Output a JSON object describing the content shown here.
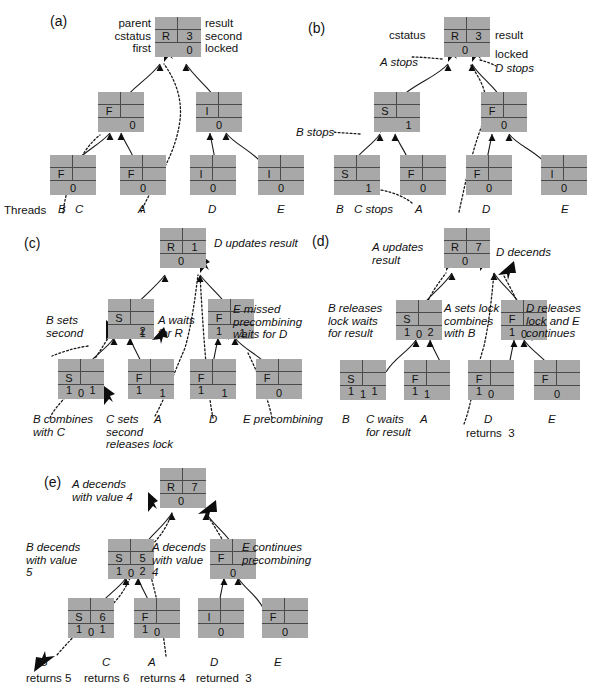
{
  "figure": {
    "type": "combining-tree-state-diagram",
    "background": "#ffffff",
    "node_fill": "#a8a8a8",
    "line_color": "#1a1a1a",
    "threads_label": "Threads",
    "thread_names": [
      "B",
      "C",
      "A",
      "D",
      "E"
    ]
  },
  "panels": [
    {
      "id": "a",
      "label": "(a)",
      "root": {
        "c1": "R",
        "c2": "3",
        "r2l": "",
        "r2r": "",
        "bottom": "0"
      },
      "mid": [
        {
          "c1": "F",
          "c2": "",
          "r2l": "",
          "r2r": "",
          "bottom": "0"
        },
        {
          "c1": "I",
          "c2": "",
          "r2l": "",
          "r2r": "",
          "bottom": "0"
        }
      ],
      "leaves": [
        {
          "c1": "F",
          "c2": "",
          "r2l": "",
          "r2r": "",
          "bottom": "0"
        },
        {
          "c1": "F",
          "c2": "",
          "r2l": "",
          "r2r": "",
          "bottom": "0"
        },
        {
          "c1": "I",
          "c2": "",
          "r2l": "",
          "r2r": "",
          "bottom": "0"
        },
        {
          "c1": "I",
          "c2": "",
          "r2l": "",
          "r2r": "",
          "bottom": "0"
        }
      ],
      "annotations": [
        {
          "text": "parent\ncstatus\nfirst"
        },
        {
          "text": "result\nsecond\nlocked"
        },
        {
          "text": "Threads"
        }
      ],
      "thread_labels": [
        "B",
        "C",
        "A",
        "D",
        "E"
      ]
    },
    {
      "id": "b",
      "label": "(b)",
      "root": {
        "c1": "R",
        "c2": "3",
        "bottom": "0"
      },
      "mid": [
        {
          "c1": "S",
          "c2": "",
          "bottom": "1"
        },
        {
          "c1": "F",
          "c2": "",
          "bottom": "0"
        }
      ],
      "leaves": [
        {
          "c1": "S",
          "c2": "",
          "bottom": "1"
        },
        {
          "c1": "F",
          "c2": "",
          "bottom": "0"
        },
        {
          "c1": "F",
          "c2": "",
          "bottom": "0"
        },
        {
          "c1": "I",
          "c2": "",
          "bottom": "0"
        }
      ],
      "annotations": [
        {
          "text": "cstatus"
        },
        {
          "text": "result"
        },
        {
          "text": "locked"
        },
        {
          "text": "A stops"
        },
        {
          "text": "D stops"
        },
        {
          "text": "B stops"
        },
        {
          "text": "C stops"
        }
      ],
      "thread_labels": [
        "B",
        "A",
        "D",
        "E"
      ]
    },
    {
      "id": "c",
      "label": "(c)",
      "root": {
        "c1": "R",
        "c2": "1",
        "bottom": "0"
      },
      "mid": [
        {
          "c1": "S",
          "c2": "",
          "r2r": "2",
          "bottom": "1"
        },
        {
          "c1": "F",
          "c2": "",
          "r2l": "1",
          "bottom": "1"
        }
      ],
      "leaves": [
        {
          "c1": "S",
          "c2": "",
          "r2l": "1",
          "r2r": "1",
          "bottom": "0"
        },
        {
          "c1": "F",
          "c2": "",
          "r2l": "1",
          "bottom": "1"
        },
        {
          "c1": "F",
          "c2": "",
          "r2l": "1",
          "bottom": "1"
        },
        {
          "c1": "F",
          "c2": "",
          "bottom": "0"
        }
      ],
      "annotations": [
        {
          "text": "D updates result"
        },
        {
          "text": "B sets\nsecond"
        },
        {
          "text": "A waits\nfor R"
        },
        {
          "text": "E missed\nprecombining\nwaits for D"
        },
        {
          "text": "B combines\nwith C"
        },
        {
          "text": "C sets\nsecond\nreleases lock"
        },
        {
          "text": "A"
        },
        {
          "text": "D"
        },
        {
          "text": "E precombining"
        }
      ]
    },
    {
      "id": "d",
      "label": "(d)",
      "root": {
        "c1": "R",
        "c2": "7",
        "bottom": "0"
      },
      "mid": [
        {
          "c1": "S",
          "c2": "",
          "r2l": "1",
          "r2r": "2",
          "bottom": "0"
        },
        {
          "c1": "F",
          "c2": "",
          "r2l": "1",
          "bottom": "0"
        }
      ],
      "leaves": [
        {
          "c1": "S",
          "c2": "",
          "r2l": "1",
          "r2r": "1",
          "bottom": "1"
        },
        {
          "c1": "F",
          "c2": "",
          "r2l": "1",
          "bottom": "1"
        },
        {
          "c1": "F",
          "c2": "",
          "r2l": "1",
          "bottom": "0"
        },
        {
          "c1": "F",
          "c2": "",
          "bottom": "0"
        }
      ],
      "annotations": [
        {
          "text": "A updates\nresult"
        },
        {
          "text": "D decends"
        },
        {
          "text": "B releases\nlock waits\nfor result"
        },
        {
          "text": "A sets lock\ncombines\nwith B"
        },
        {
          "text": "D releases\nlock and E\ncontinues"
        },
        {
          "text": "B"
        },
        {
          "text": "C waits\nfor result"
        },
        {
          "text": "A"
        },
        {
          "text": "D"
        },
        {
          "text": "returns  3"
        },
        {
          "text": "E"
        }
      ]
    },
    {
      "id": "e",
      "label": "(e)",
      "root": {
        "c1": "R",
        "c2": "7",
        "bottom": "0"
      },
      "mid": [
        {
          "c1": "S",
          "c2": "5",
          "r2l": "1",
          "r2r": "2",
          "bottom": "0"
        },
        {
          "c1": "F",
          "c2": "",
          "bottom": "0"
        }
      ],
      "leaves": [
        {
          "c1": "S",
          "c2": "6",
          "r2l": "1",
          "r2r": "1",
          "bottom": "0"
        },
        {
          "c1": "F",
          "c2": "",
          "r2l": "1",
          "bottom": "0"
        },
        {
          "c1": "I",
          "c2": "",
          "bottom": "0"
        },
        {
          "c1": "F",
          "c2": "",
          "bottom": "0"
        }
      ],
      "annotations": [
        {
          "text": "A decends\nwith value 4"
        },
        {
          "text": "B decends\nwith value\n5"
        },
        {
          "text": "A decends\nwith value\n4"
        },
        {
          "text": "E continues\nprecombining"
        },
        {
          "text": "B"
        },
        {
          "text": "returns 5"
        },
        {
          "text": "C"
        },
        {
          "text": "returns 6"
        },
        {
          "text": "A"
        },
        {
          "text": "returns 4"
        },
        {
          "text": "D"
        },
        {
          "text": "returned  3"
        },
        {
          "text": "E"
        }
      ]
    }
  ]
}
